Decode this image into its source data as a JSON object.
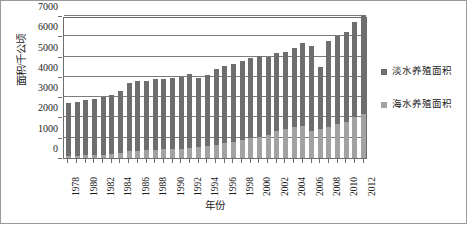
{
  "chart_data": {
    "type": "bar",
    "stacked": true,
    "title": "",
    "xlabel": "年份",
    "ylabel": "面积/千公顷",
    "ylim": [
      0,
      7000
    ],
    "ytick_step": 1000,
    "yticks": [
      0,
      1000,
      2000,
      3000,
      4000,
      5000,
      6000,
      7000
    ],
    "ytick_labels": [
      "0",
      "1000",
      "2000",
      "3000",
      "4000",
      "5000",
      "6000",
      "7000"
    ],
    "grid": true,
    "grid_axis": "y",
    "legend_position": "right",
    "categories": [
      "1978",
      "1979",
      "1980",
      "1981",
      "1982",
      "1983",
      "1984",
      "1985",
      "1986",
      "1987",
      "1988",
      "1989",
      "1990",
      "1991",
      "1992",
      "1993",
      "1994",
      "1995",
      "1996",
      "1997",
      "1998",
      "1999",
      "2000",
      "2001",
      "2002",
      "2003",
      "2004",
      "2005",
      "2006",
      "2007",
      "2008",
      "2009",
      "2010",
      "2011",
      "2012"
    ],
    "xtick_labels_shown": [
      "1978",
      "1980",
      "1982",
      "1984",
      "1986",
      "1988",
      "1990",
      "1992",
      "1994",
      "1996",
      "1998",
      "2000",
      "2002",
      "2004",
      "2006",
      "2008",
      "2010",
      "2012"
    ],
    "series": [
      {
        "name": "海水养殖面积",
        "color": "#a2a2a2",
        "values": [
          110,
          120,
          130,
          150,
          170,
          200,
          240,
          330,
          360,
          380,
          400,
          420,
          440,
          450,
          470,
          520,
          590,
          650,
          740,
          810,
          900,
          980,
          1060,
          1110,
          1330,
          1450,
          1530,
          1560,
          1340,
          1420,
          1550,
          1700,
          1800,
          2000,
          2180
        ]
      },
      {
        "name": "淡水养殖面积",
        "color": "#6e6e6e",
        "values": [
          2610,
          2650,
          2710,
          2770,
          2830,
          2900,
          3060,
          3370,
          3430,
          3420,
          3500,
          3490,
          3480,
          3520,
          3660,
          3410,
          3480,
          3740,
          3780,
          3820,
          3870,
          3950,
          3980,
          3890,
          3840,
          3790,
          3900,
          4130,
          4200,
          3060,
          4200,
          4300,
          4400,
          4700,
          4880
        ]
      }
    ],
    "totals": [
      2720,
      2770,
      2840,
      2920,
      3000,
      3100,
      3300,
      3700,
      3790,
      3800,
      3900,
      3910,
      3920,
      3970,
      4130,
      3930,
      4070,
      4390,
      4520,
      4630,
      4770,
      4930,
      5040,
      5000,
      5170,
      5240,
      5430,
      5690,
      5540,
      4480,
      5750,
      6000,
      6200,
      6700,
      7060
    ]
  },
  "legend": {
    "items": [
      {
        "label": "淡水养殖面积",
        "color": "#6e6e6e"
      },
      {
        "label": "海水养殖面积",
        "color": "#a2a2a2"
      }
    ]
  },
  "axes": {
    "y_title": "面积/千公顷",
    "x_title": "年份"
  }
}
